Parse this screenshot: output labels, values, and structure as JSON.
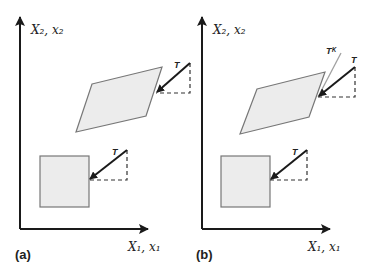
{
  "panels": [
    {
      "label": "(a)",
      "y_axis_label": "X₂, x₂",
      "x_axis_label": "X₁, x₁",
      "deformed_body_force_label": "T",
      "reference_body_force_label": "T"
    },
    {
      "label": "(b)",
      "y_axis_label": "X₂, x₂",
      "x_axis_label": "X₁, x₁",
      "deformed_body_force_label": "T",
      "deformed_body_extra_force_label": "Tᴷ",
      "reference_body_force_label": "T"
    }
  ],
  "colors": {
    "axis": "#1a1a1a",
    "shape_fill": "#ececec",
    "shape_stroke": "#777777",
    "arrow": "#1a1a1a",
    "kappa_line": "#a0a0a0"
  }
}
